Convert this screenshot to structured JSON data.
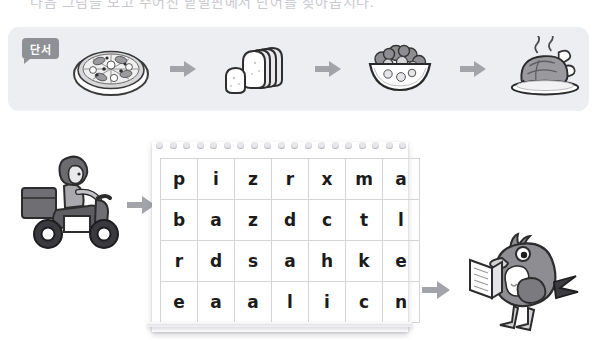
{
  "page": {
    "instruction_text": "다음 그림을 보고 주어진 낱말판에서 단어를 찾아봅시다."
  },
  "clue_panel": {
    "badge_label": "단서",
    "badge_color": "#8e9096",
    "panel_color": "#eceef1",
    "items": [
      {
        "name": "pizza",
        "label": "pizza"
      },
      {
        "name": "bread",
        "label": "bread"
      },
      {
        "name": "salad",
        "label": "salad"
      },
      {
        "name": "chicken",
        "label": "chicken"
      }
    ],
    "arrow_color": "#a3a4a9",
    "arrow_count": 3
  },
  "notepad": {
    "hole_count": 19,
    "grid": {
      "rows": 4,
      "cols": 7,
      "letters": [
        [
          "p",
          "i",
          "z",
          "r",
          "x",
          "m",
          "a"
        ],
        [
          "b",
          "a",
          "z",
          "d",
          "c",
          "t",
          "l"
        ],
        [
          "r",
          "d",
          "s",
          "a",
          "h",
          "k",
          "e"
        ],
        [
          "e",
          "a",
          "a",
          "l",
          "i",
          "c",
          "n"
        ]
      ]
    }
  },
  "characters": {
    "rider": {
      "name": "delivery-scooter-rider",
      "label": "delivery rider on scooter"
    },
    "bird": {
      "name": "bird-reading-book",
      "label": "bird holding a book"
    }
  },
  "arrows": {
    "rider_to_grid": "arrow-right",
    "grid_to_bird": "arrow-right"
  },
  "colors": {
    "ink": "#1b1b1b",
    "grid_line": "#d3d4d8",
    "panel_bg": "#eceef1",
    "arrow": "#a3a4a9"
  }
}
